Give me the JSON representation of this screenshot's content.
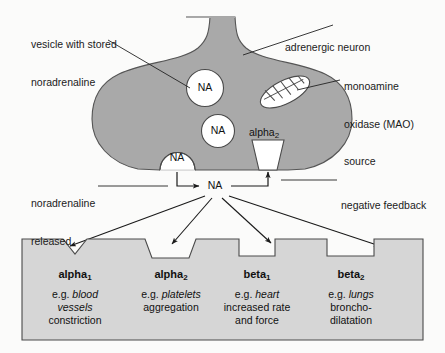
{
  "figure": {
    "background_color": "#fbfbfa",
    "neuron_fill": "#a9a9a9",
    "neuron_stroke": "#555555",
    "effector_fill": "#d6d6d6",
    "effector_stroke": "#4a4a4a",
    "vesicle_fill": "#ffffff",
    "line_color": "#222222"
  },
  "callouts": {
    "vesicle": {
      "line1": "vesicle with stored",
      "line2": "noradrenaline"
    },
    "neuron": {
      "line1": "adrenergic neuron"
    },
    "mao": {
      "line1": "monoamine",
      "line2": "oxidase (MAO)",
      "line3": "source"
    },
    "released": {
      "line1": "noradrenaline",
      "line2": "released"
    },
    "feedback": {
      "line1": "negative feedback"
    }
  },
  "molecules": {
    "vesicle_top": "NA",
    "vesicle_mid": "NA",
    "vesicle_release": "NA",
    "cleft": "NA"
  },
  "autoreceptor": {
    "name": "alpha",
    "subscript": "2"
  },
  "receptors": [
    {
      "name": "alpha",
      "subscript": "1",
      "shape": "v-notch",
      "desc_lines": [
        [
          {
            "t": "e.g. ",
            "style": "normal"
          },
          {
            "t": "blood",
            "style": "italic"
          }
        ],
        [
          {
            "t": "vessels",
            "style": "italic"
          }
        ],
        [
          {
            "t": "constriction",
            "style": "normal"
          }
        ]
      ]
    },
    {
      "name": "alpha",
      "subscript": "2",
      "shape": "trapezoid",
      "desc_lines": [
        [
          {
            "t": "e.g. ",
            "style": "normal"
          },
          {
            "t": "platelets",
            "style": "italic"
          }
        ],
        [
          {
            "t": "aggregation",
            "style": "normal"
          }
        ]
      ]
    },
    {
      "name": "beta",
      "subscript": "1",
      "shape": "rectangle",
      "desc_lines": [
        [
          {
            "t": "e.g. ",
            "style": "normal"
          },
          {
            "t": "heart",
            "style": "italic"
          }
        ],
        [
          {
            "t": "increased rate",
            "style": "normal"
          }
        ],
        [
          {
            "t": "and force",
            "style": "normal"
          }
        ]
      ]
    },
    {
      "name": "beta",
      "subscript": "2",
      "shape": "rectangle",
      "desc_lines": [
        [
          {
            "t": "e.g. ",
            "style": "normal"
          },
          {
            "t": "lungs",
            "style": "italic"
          }
        ],
        [
          {
            "t": "broncho-",
            "style": "normal"
          }
        ],
        [
          {
            "t": "dilatation",
            "style": "normal"
          }
        ]
      ]
    }
  ]
}
